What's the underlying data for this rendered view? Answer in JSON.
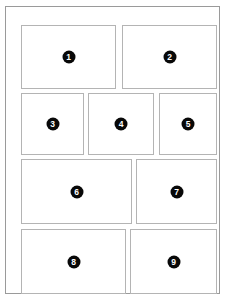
{
  "document": {
    "title": "Numbered Panel Layout",
    "frame": {
      "border_color": "#9a9a9a",
      "background_color": "#ffffff"
    }
  },
  "style": {
    "panel_border_color": "#b4b4b4",
    "panel_background_color": "#ffffff",
    "badge_fill_color": "#080808",
    "badge_text_color": "#ffffff"
  },
  "panels": [
    {
      "number": "1",
      "row": 1,
      "column": 1,
      "x": 0,
      "y": 0,
      "width": 95,
      "height": 64
    },
    {
      "number": "2",
      "row": 1,
      "column": 2,
      "x": 101,
      "y": 0,
      "width": 95,
      "height": 64
    },
    {
      "number": "3",
      "row": 2,
      "column": 1,
      "x": 0,
      "y": 68,
      "width": 63,
      "height": 62
    },
    {
      "number": "4",
      "row": 2,
      "column": 2,
      "x": 67,
      "y": 68,
      "width": 66,
      "height": 62
    },
    {
      "number": "5",
      "row": 2,
      "column": 3,
      "x": 138,
      "y": 68,
      "width": 58,
      "height": 62
    },
    {
      "number": "6",
      "row": 3,
      "column": 1,
      "x": 0,
      "y": 134,
      "width": 111,
      "height": 65
    },
    {
      "number": "7",
      "row": 3,
      "column": 2,
      "x": 115,
      "y": 134,
      "width": 81,
      "height": 65
    },
    {
      "number": "8",
      "row": 4,
      "column": 1,
      "x": 0,
      "y": 204,
      "width": 105,
      "height": 65
    },
    {
      "number": "9",
      "row": 4,
      "column": 2,
      "x": 109,
      "y": 204,
      "width": 87,
      "height": 65
    }
  ]
}
